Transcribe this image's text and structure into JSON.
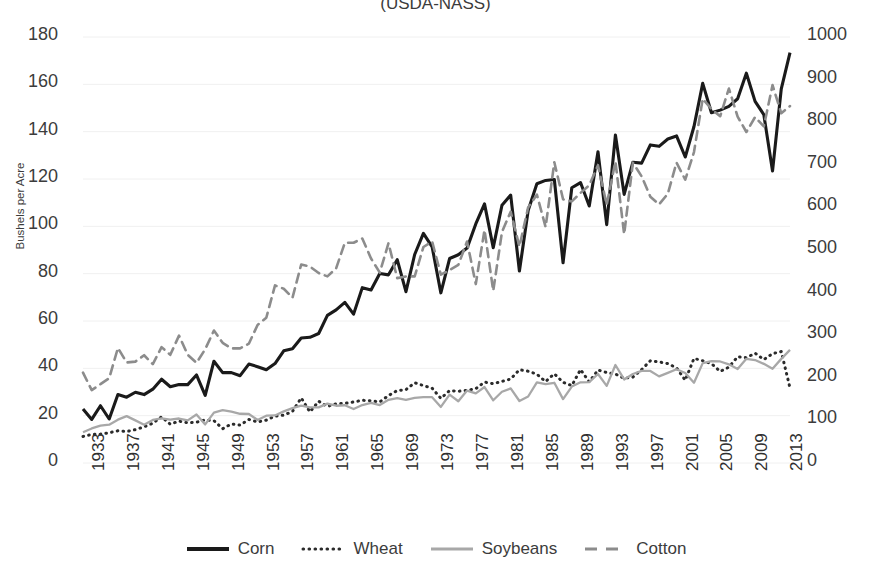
{
  "title": "(USDA-NASS)",
  "axes": {
    "left": {
      "label": "Bushels per Acre",
      "ticks": [
        "180",
        "160",
        "140",
        "120",
        "100",
        "80",
        "60",
        "40",
        "20",
        "0"
      ],
      "min": 0,
      "max": 180,
      "step": 20
    },
    "right": {
      "label": "",
      "ticks": [
        "1000",
        "900",
        "800",
        "700",
        "600",
        "500",
        "400",
        "300",
        "200",
        "100",
        "0"
      ],
      "min": 0,
      "max": 1000,
      "step": 100
    },
    "x": {
      "ticks": [
        "1933",
        "1937",
        "1941",
        "1945",
        "1949",
        "1953",
        "1957",
        "1961",
        "1965",
        "1969",
        "1973",
        "1977",
        "1981",
        "1985",
        "1989",
        "1993",
        "1997",
        "2001",
        "2005",
        "2009",
        "2013"
      ]
    }
  },
  "legend": {
    "position": "bottom",
    "items": [
      {
        "label": "Corn",
        "style": "solid-thick",
        "color": "#1a1a1a"
      },
      {
        "label": "Wheat",
        "style": "dotted",
        "color": "#2b2b2b"
      },
      {
        "label": "Soybeans",
        "style": "solid-thin",
        "color": "#a8a8a8"
      },
      {
        "label": "Cotton",
        "style": "dashed",
        "color": "#8c8c8c"
      }
    ]
  },
  "chart_data": {
    "type": "line",
    "title": "(USDA-NASS)",
    "xlabel": "",
    "ylabel": "Bushels per Acre",
    "ylim": [
      0,
      180
    ],
    "y2lim": [
      0,
      1000
    ],
    "grid": true,
    "x": [
      1933,
      1934,
      1935,
      1936,
      1937,
      1938,
      1939,
      1940,
      1941,
      1942,
      1943,
      1944,
      1945,
      1946,
      1947,
      1948,
      1949,
      1950,
      1951,
      1952,
      1953,
      1954,
      1955,
      1956,
      1957,
      1958,
      1959,
      1960,
      1961,
      1962,
      1963,
      1964,
      1965,
      1966,
      1967,
      1968,
      1969,
      1970,
      1971,
      1972,
      1973,
      1974,
      1975,
      1976,
      1977,
      1978,
      1979,
      1980,
      1981,
      1982,
      1983,
      1984,
      1985,
      1986,
      1987,
      1988,
      1989,
      1990,
      1991,
      1992,
      1993,
      1994,
      1995,
      1996,
      1997,
      1998,
      1999,
      2000,
      2001,
      2002,
      2003,
      2004,
      2005,
      2006,
      2007,
      2008,
      2009,
      2010,
      2011,
      2012,
      2013,
      2014
    ],
    "series": [
      {
        "name": "Corn",
        "axis": "left",
        "units": "bushels per acre",
        "values": [
          22.8,
          18.4,
          24.2,
          18.6,
          28.9,
          27.8,
          29.9,
          28.9,
          31.2,
          35.4,
          32.2,
          33.2,
          33.1,
          37.2,
          28.6,
          43.0,
          38.2,
          38.2,
          36.9,
          41.8,
          40.7,
          39.4,
          42.0,
          47.4,
          48.3,
          52.8,
          53.1,
          54.7,
          62.4,
          64.7,
          67.9,
          62.9,
          74.1,
          73.1,
          80.1,
          79.5,
          85.9,
          72.4,
          88.1,
          97.0,
          91.3,
          71.9,
          86.4,
          88.0,
          90.8,
          101.0,
          109.5,
          91.0,
          108.9,
          113.2,
          81.1,
          106.7,
          118.0,
          119.4,
          119.8,
          84.6,
          116.3,
          118.5,
          108.6,
          131.5,
          100.7,
          138.6,
          113.5,
          127.1,
          126.7,
          134.4,
          133.8,
          136.9,
          138.2,
          129.3,
          142.2,
          160.4,
          148.0,
          149.1,
          150.7,
          153.9,
          164.7,
          152.8,
          147.2,
          123.4,
          158.1,
          173.4
        ]
      },
      {
        "name": "Wheat",
        "axis": "left",
        "units": "bushels per acre",
        "values": [
          11.2,
          12.1,
          12.2,
          12.8,
          13.6,
          13.3,
          14.1,
          15.3,
          16.8,
          19.5,
          16.4,
          17.7,
          17.0,
          17.2,
          18.2,
          17.9,
          14.5,
          16.5,
          16.0,
          18.4,
          17.3,
          18.1,
          19.8,
          20.2,
          21.8,
          27.5,
          21.6,
          26.1,
          23.9,
          25.0,
          25.2,
          25.8,
          26.5,
          26.3,
          25.8,
          28.5,
          30.6,
          31.0,
          33.9,
          32.7,
          31.6,
          27.3,
          30.6,
          30.3,
          30.7,
          31.4,
          34.2,
          33.5,
          34.5,
          35.5,
          39.4,
          38.8,
          37.5,
          34.4,
          37.7,
          34.1,
          32.7,
          39.5,
          34.3,
          39.3,
          38.2,
          37.6,
          35.8,
          36.3,
          39.5,
          43.2,
          42.7,
          42.0,
          40.2,
          35.0,
          44.2,
          43.2,
          42.0,
          38.7,
          40.5,
          44.9,
          44.5,
          46.4,
          43.7,
          46.2,
          47.1,
          31.7
        ]
      },
      {
        "name": "Soybeans",
        "axis": "left",
        "units": "bushels per acre",
        "values": [
          13.0,
          14.6,
          15.8,
          16.2,
          18.3,
          19.8,
          18.0,
          16.2,
          18.2,
          18.9,
          18.3,
          18.8,
          18.0,
          20.5,
          16.3,
          21.3,
          22.3,
          21.7,
          20.8,
          20.7,
          18.2,
          20.0,
          20.1,
          21.8,
          23.2,
          24.2,
          23.5,
          23.5,
          25.1,
          24.2,
          24.4,
          22.8,
          24.5,
          25.4,
          24.5,
          26.7,
          27.4,
          26.7,
          27.5,
          27.8,
          27.8,
          23.7,
          28.9,
          26.1,
          30.6,
          29.4,
          32.1,
          26.5,
          30.1,
          31.5,
          26.2,
          28.1,
          34.1,
          33.3,
          33.9,
          27.0,
          32.3,
          34.1,
          34.2,
          37.6,
          32.6,
          41.4,
          35.3,
          37.6,
          38.9,
          38.9,
          36.6,
          38.1,
          39.6,
          38.0,
          33.9,
          42.2,
          43.0,
          42.9,
          41.7,
          39.7,
          44.0,
          43.5,
          41.9,
          39.8,
          44.0,
          47.8
        ]
      },
      {
        "name": "Cotton",
        "axis": "right",
        "units": "pounds per acre",
        "values": [
          212,
          171,
          185,
          199,
          270,
          236,
          238,
          253,
          232,
          272,
          254,
          299,
          254,
          235,
          267,
          311,
          282,
          269,
          269,
          280,
          324,
          341,
          417,
          409,
          388,
          466,
          461,
          446,
          438,
          457,
          517,
          517,
          527,
          480,
          447,
          516,
          434,
          438,
          438,
          507,
          520,
          442,
          453,
          465,
          520,
          420,
          547,
          404,
          542,
          590,
          508,
          600,
          630,
          554,
          706,
          619,
          614,
          634,
          652,
          699,
          606,
          708,
          537,
          705,
          673,
          625,
          607,
          632,
          705,
          665,
          730,
          855,
          831,
          814,
          879,
          813,
          777,
          812,
          790,
          887,
          821,
          838
        ]
      }
    ]
  }
}
